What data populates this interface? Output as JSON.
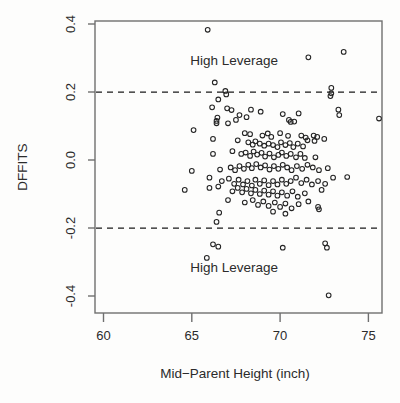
{
  "chart_data": {
    "type": "scatter",
    "title": "",
    "xlabel": "Mid−Parent Height (inch)",
    "ylabel": "DFFITS",
    "xlim": [
      59.4,
      76.0
    ],
    "ylim": [
      -0.445,
      0.415
    ],
    "xticks": [
      60,
      65,
      70,
      75
    ],
    "xticklabels": [
      "60",
      "65",
      "70",
      "75"
    ],
    "yticks": [
      0.4,
      0.2,
      0.0,
      -0.2,
      -0.4
    ],
    "yticklabels": [
      "0.4",
      "0.2",
      "0.0",
      "-0.2",
      "-0.4"
    ],
    "grid": false,
    "legend": null,
    "marker": "open-circle",
    "marker_color": "#242424",
    "reference_lines": [
      {
        "orientation": "horizontal",
        "value": 0.2,
        "style": "dashed",
        "color": "#1a1a1a"
      },
      {
        "orientation": "horizontal",
        "value": -0.2,
        "style": "dashed",
        "color": "#1a1a1a"
      }
    ],
    "annotations": [
      {
        "text": "High Leverage",
        "x": 67.4,
        "y": 0.295
      },
      {
        "text": "High Leverage",
        "x": 67.4,
        "y": -0.315
      }
    ],
    "points": [
      [
        65.9,
        0.383
      ],
      [
        71.6,
        0.302
      ],
      [
        73.6,
        0.318
      ],
      [
        66.3,
        0.228
      ],
      [
        66.9,
        0.203
      ],
      [
        66.95,
        0.193
      ],
      [
        72.9,
        0.212
      ],
      [
        72.9,
        0.196
      ],
      [
        72.85,
        0.188
      ],
      [
        66.5,
        0.178
      ],
      [
        66.15,
        0.155
      ],
      [
        67.0,
        0.152
      ],
      [
        67.25,
        0.147
      ],
      [
        68.35,
        0.148
      ],
      [
        68.9,
        0.142
      ],
      [
        73.3,
        0.148
      ],
      [
        73.35,
        0.132
      ],
      [
        66.45,
        0.125
      ],
      [
        67.7,
        0.132
      ],
      [
        68.1,
        0.126
      ],
      [
        70.15,
        0.135
      ],
      [
        71.05,
        0.137
      ],
      [
        66.4,
        0.115
      ],
      [
        66.4,
        0.108
      ],
      [
        67.05,
        0.108
      ],
      [
        67.5,
        0.118
      ],
      [
        70.5,
        0.118
      ],
      [
        70.6,
        0.112
      ],
      [
        70.8,
        0.113
      ],
      [
        75.6,
        0.122
      ],
      [
        65.1,
        0.088
      ],
      [
        68.0,
        0.079
      ],
      [
        68.3,
        0.076
      ],
      [
        69.0,
        0.072
      ],
      [
        69.3,
        0.078
      ],
      [
        69.5,
        0.068
      ],
      [
        70.0,
        0.079
      ],
      [
        70.45,
        0.071
      ],
      [
        71.2,
        0.072
      ],
      [
        71.45,
        0.066
      ],
      [
        71.9,
        0.072
      ],
      [
        72.1,
        0.068
      ],
      [
        66.2,
        0.062
      ],
      [
        67.6,
        0.058
      ],
      [
        68.2,
        0.052
      ],
      [
        68.45,
        0.045
      ],
      [
        68.6,
        0.055
      ],
      [
        68.85,
        0.048
      ],
      [
        69.1,
        0.042
      ],
      [
        69.35,
        0.048
      ],
      [
        69.6,
        0.044
      ],
      [
        69.85,
        0.038
      ],
      [
        70.05,
        0.052
      ],
      [
        70.3,
        0.044
      ],
      [
        70.55,
        0.05
      ],
      [
        70.75,
        0.038
      ],
      [
        71.0,
        0.048
      ],
      [
        71.3,
        0.04
      ],
      [
        71.55,
        0.058
      ],
      [
        71.95,
        0.056
      ],
      [
        72.5,
        0.062
      ],
      [
        67.3,
        0.026
      ],
      [
        67.8,
        0.018
      ],
      [
        68.05,
        0.022
      ],
      [
        68.3,
        0.012
      ],
      [
        68.5,
        0.025
      ],
      [
        68.7,
        0.016
      ],
      [
        68.95,
        0.021
      ],
      [
        69.15,
        0.01
      ],
      [
        69.4,
        0.019
      ],
      [
        69.65,
        0.008
      ],
      [
        69.9,
        0.015
      ],
      [
        70.1,
        0.022
      ],
      [
        70.35,
        0.012
      ],
      [
        70.6,
        0.018
      ],
      [
        70.9,
        0.008
      ],
      [
        71.15,
        0.018
      ],
      [
        71.4,
        0.006
      ],
      [
        72.0,
        0.008
      ],
      [
        66.2,
        0.018
      ],
      [
        65.0,
        -0.032
      ],
      [
        66.6,
        -0.028
      ],
      [
        67.2,
        -0.022
      ],
      [
        67.45,
        -0.03
      ],
      [
        67.7,
        -0.018
      ],
      [
        67.95,
        -0.026
      ],
      [
        68.2,
        -0.014
      ],
      [
        68.4,
        -0.024
      ],
      [
        68.65,
        -0.012
      ],
      [
        68.9,
        -0.022
      ],
      [
        69.15,
        -0.016
      ],
      [
        69.4,
        -0.028
      ],
      [
        69.65,
        -0.018
      ],
      [
        69.9,
        -0.026
      ],
      [
        70.15,
        -0.014
      ],
      [
        70.4,
        -0.022
      ],
      [
        70.65,
        -0.03
      ],
      [
        70.95,
        -0.018
      ],
      [
        71.25,
        -0.026
      ],
      [
        71.55,
        -0.014
      ],
      [
        71.85,
        -0.022
      ],
      [
        72.2,
        -0.03
      ],
      [
        72.7,
        -0.024
      ],
      [
        66.0,
        -0.052
      ],
      [
        66.7,
        -0.062
      ],
      [
        67.1,
        -0.055
      ],
      [
        67.4,
        -0.07
      ],
      [
        67.65,
        -0.058
      ],
      [
        67.9,
        -0.072
      ],
      [
        68.15,
        -0.062
      ],
      [
        68.4,
        -0.075
      ],
      [
        68.6,
        -0.058
      ],
      [
        68.85,
        -0.07
      ],
      [
        69.1,
        -0.06
      ],
      [
        69.35,
        -0.074
      ],
      [
        69.6,
        -0.062
      ],
      [
        69.85,
        -0.072
      ],
      [
        70.1,
        -0.058
      ],
      [
        70.35,
        -0.07
      ],
      [
        70.6,
        -0.062
      ],
      [
        70.9,
        -0.052
      ],
      [
        71.2,
        -0.068
      ],
      [
        71.5,
        -0.058
      ],
      [
        71.8,
        -0.072
      ],
      [
        72.15,
        -0.062
      ],
      [
        72.55,
        -0.07
      ],
      [
        73.0,
        -0.052
      ],
      [
        73.8,
        -0.05
      ],
      [
        64.6,
        -0.088
      ],
      [
        66.0,
        -0.082
      ],
      [
        66.5,
        -0.078
      ],
      [
        67.3,
        -0.092
      ],
      [
        67.6,
        -0.082
      ],
      [
        67.85,
        -0.095
      ],
      [
        68.1,
        -0.085
      ],
      [
        68.35,
        -0.098
      ],
      [
        68.6,
        -0.088
      ],
      [
        68.85,
        -0.1
      ],
      [
        69.1,
        -0.09
      ],
      [
        69.35,
        -0.102
      ],
      [
        69.6,
        -0.092
      ],
      [
        69.85,
        -0.105
      ],
      [
        70.1,
        -0.095
      ],
      [
        70.4,
        -0.105
      ],
      [
        70.7,
        -0.092
      ],
      [
        71.0,
        -0.108
      ],
      [
        71.4,
        -0.098
      ],
      [
        72.35,
        -0.088
      ],
      [
        67.05,
        -0.118
      ],
      [
        68.0,
        -0.125
      ],
      [
        68.45,
        -0.118
      ],
      [
        68.75,
        -0.132
      ],
      [
        69.05,
        -0.122
      ],
      [
        69.35,
        -0.135
      ],
      [
        69.7,
        -0.125
      ],
      [
        70.0,
        -0.138
      ],
      [
        70.3,
        -0.128
      ],
      [
        70.65,
        -0.142
      ],
      [
        71.05,
        -0.13
      ],
      [
        71.6,
        -0.122
      ],
      [
        72.15,
        -0.138
      ],
      [
        72.2,
        -0.145
      ],
      [
        66.55,
        -0.155
      ],
      [
        69.6,
        -0.152
      ],
      [
        70.3,
        -0.158
      ],
      [
        66.4,
        -0.182
      ],
      [
        66.2,
        -0.248
      ],
      [
        66.5,
        -0.255
      ],
      [
        70.15,
        -0.258
      ],
      [
        72.55,
        -0.245
      ],
      [
        72.65,
        -0.258
      ],
      [
        65.85,
        -0.288
      ],
      [
        72.75,
        -0.398
      ]
    ]
  },
  "axes": {
    "frame_color": "#6f6f6f",
    "text_color": "#2b2b2b"
  }
}
